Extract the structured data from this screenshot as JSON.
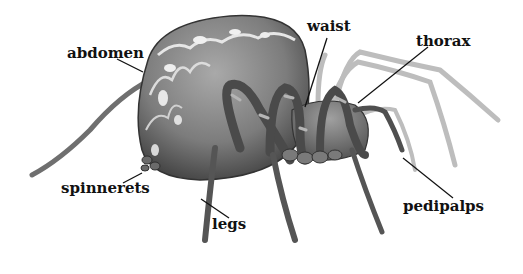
{
  "diagram": {
    "labels": [
      {
        "id": "abdomen",
        "text": "abdomen"
      },
      {
        "id": "waist",
        "text": "waist"
      },
      {
        "id": "thorax",
        "text": "thorax"
      },
      {
        "id": "spinnerets",
        "text": "spinnerets"
      },
      {
        "id": "legs",
        "text": "legs"
      },
      {
        "id": "pedipalps",
        "text": "pedipalps"
      }
    ],
    "colors": {
      "label_text": "#111111",
      "leader_line": "#111111",
      "body_dark": "#3a3a3a",
      "body_mid": "#7a7a7a",
      "body_light": "#c8c8c8",
      "background": "#ffffff"
    }
  }
}
